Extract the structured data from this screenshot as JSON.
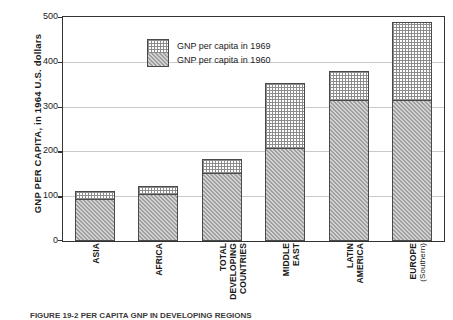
{
  "chart_data": {
    "type": "bar",
    "title": "",
    "xlabel": "",
    "ylabel": "GNP PER CAPITA, in 1964 U.S. dollars",
    "ylim": [
      0,
      500
    ],
    "yticks": [
      0,
      100,
      200,
      300,
      400,
      500
    ],
    "grid": true,
    "stacked": true,
    "legend_position": "top-left",
    "categories": [
      "ASIA",
      "AFRICA",
      "TOTAL DEVELOPING COUNTRIES",
      "MIDDLE EAST",
      "LATIN AMERICA",
      "EUROPE (Southern)"
    ],
    "category_lines": [
      [
        "ASIA"
      ],
      [
        "AFRICA"
      ],
      [
        "TOTAL",
        "DEVELOPING",
        "COUNTRIES"
      ],
      [
        "MIDDLE",
        "EAST"
      ],
      [
        "LATIN",
        "AMERICA"
      ],
      [
        "EUROPE",
        "(Southern)"
      ]
    ],
    "series": [
      {
        "name": "GNP per capita in 1960",
        "values": [
          94,
          105,
          152,
          208,
          315,
          315
        ]
      },
      {
        "name": "GNP per capita in 1969",
        "values": [
          112,
          123,
          183,
          353,
          379,
          489
        ]
      }
    ]
  },
  "legend": {
    "items": [
      {
        "label": "GNP per capita in 1969",
        "pattern": "dotted-grid"
      },
      {
        "label": "GNP per capita in 1960",
        "pattern": "solid-gray-hatch"
      }
    ]
  },
  "axis": {
    "y_title": "GNP PER CAPITA, in 1964 U.S. dollars",
    "y_tick_labels": [
      "500",
      "400",
      "300",
      "200",
      "100",
      "0"
    ]
  },
  "caption": {
    "text": "FIGURE 19-2  PER CAPITA GNP IN DEVELOPING REGIONS"
  },
  "colors": {
    "axis": "#333333",
    "grid": "#c9c9c9",
    "bar_1960": "#9e9e9e",
    "bar_1969": "#ffffff",
    "bar_outline": "#4a4a4a",
    "text": "#1a1a1a"
  }
}
